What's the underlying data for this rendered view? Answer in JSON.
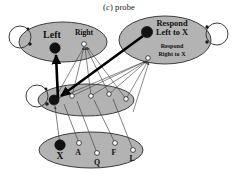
{
  "caption": {
    "prefix": "(",
    "italic_letter": "c",
    "suffix": ")",
    "text": "probe",
    "full": "(c) probe"
  },
  "colors": {
    "ellipse_fill": "#b3b3b3",
    "ellipse_stroke": "#3d3d3d",
    "node_active_fill": "#111111",
    "node_inactive_fill": "#ffffff",
    "node_stroke": "#222222",
    "link_thin": "#3a3a3a",
    "link_thick": "#000000",
    "background": "#ffffff",
    "text": "#111111"
  },
  "layers": [
    {
      "id": "response-layer-left",
      "name": "left-right-layer",
      "cx": 63,
      "cy": 42,
      "rx": 44,
      "ry": 20,
      "self_loop": true,
      "nodes": [
        {
          "id": "node-left",
          "label": "Left",
          "label_size": 9.5,
          "x": 55,
          "y": 48,
          "r": 5.2,
          "active": true,
          "label_dx": -3,
          "label_dy": -10
        },
        {
          "id": "node-right",
          "label": "Right",
          "label_size": 7.0,
          "x": 84,
          "y": 44,
          "r": 2.4,
          "active": false,
          "label_dx": 0,
          "label_dy": -8
        }
      ]
    },
    {
      "id": "response-layer-right",
      "name": "respond-to-x-layer",
      "cx": 165,
      "cy": 40,
      "rx": 46,
      "ry": 24,
      "self_loop": true,
      "nodes": [
        {
          "id": "node-respond-left-to-x",
          "label": "Respond\nLeft to X",
          "label_size": 8.2,
          "x": 147,
          "y": 32,
          "r": 5.6,
          "active": true,
          "label_dx": 24,
          "label_dy": -8
        },
        {
          "id": "node-respond-right-to-x",
          "label": "Respond\nRight to X",
          "label_size": 6.0,
          "x": 148,
          "y": 58,
          "r": 2.3,
          "active": false,
          "label_dx": 24,
          "label_dy": -10
        }
      ]
    },
    {
      "id": "hidden-layer",
      "name": "hidden-layer",
      "cx": 86,
      "cy": 100,
      "rx": 48,
      "ry": 16,
      "self_loop": true,
      "nodes": [
        {
          "id": "hidden-0",
          "label": "",
          "x": 54,
          "y": 100,
          "r": 5.0,
          "active": true
        },
        {
          "id": "hidden-1",
          "label": "",
          "x": 72,
          "y": 96,
          "r": 2.3,
          "active": false
        },
        {
          "id": "hidden-2",
          "label": "",
          "x": 91,
          "y": 96,
          "r": 2.3,
          "active": false
        },
        {
          "id": "hidden-3",
          "label": "",
          "x": 109,
          "y": 94,
          "r": 2.3,
          "active": false
        },
        {
          "id": "hidden-4",
          "label": "",
          "x": 126,
          "y": 99,
          "r": 2.3,
          "active": false
        }
      ]
    },
    {
      "id": "input-layer",
      "name": "letter-input-layer",
      "cx": 91,
      "cy": 150,
      "rx": 52,
      "ry": 18,
      "self_loop": false,
      "nodes": [
        {
          "id": "input-x",
          "label": "X",
          "label_size": 9.0,
          "x": 60,
          "y": 145,
          "r": 5.2,
          "active": true,
          "label_dx": 0,
          "label_dy": 12
        },
        {
          "id": "input-a",
          "label": "A",
          "label_size": 7.5,
          "x": 79,
          "y": 143,
          "r": 2.4,
          "active": false,
          "label_dx": -1,
          "label_dy": 10
        },
        {
          "id": "input-q",
          "label": "Q",
          "label_size": 7.5,
          "x": 97,
          "y": 153,
          "r": 2.4,
          "active": false,
          "label_dx": 0,
          "label_dy": 10
        },
        {
          "id": "input-f",
          "label": "F",
          "label_size": 7.5,
          "x": 115,
          "y": 143,
          "r": 2.4,
          "active": false,
          "label_dx": -1,
          "label_dy": 10
        },
        {
          "id": "input-l",
          "label": "L",
          "label_size": 7.5,
          "x": 133,
          "y": 150,
          "r": 2.4,
          "active": false,
          "label_dx": -1,
          "label_dy": 9
        }
      ]
    }
  ],
  "labels": {
    "left": "Left",
    "right": "Right",
    "respond_left_to_x_line1": "Respond",
    "respond_left_to_x_line2": "Left to X",
    "respond_right_to_x_line1": "Respond",
    "respond_right_to_x_line2": "Right to X",
    "input_x": "X",
    "input_a": "A",
    "input_q": "Q",
    "input_f": "F",
    "input_l": "L"
  }
}
